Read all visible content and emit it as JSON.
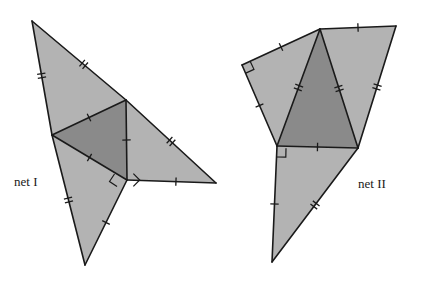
{
  "figure": {
    "canvas": {
      "width": 424,
      "height": 285,
      "background": "#ffffff"
    },
    "palette": {
      "light_face": "#b3b3b3",
      "mid_face": "#a8a8a8",
      "dark_face": "#8a8a8a",
      "outline": "#1a1a1a",
      "label_color": "#1a1a1a"
    },
    "labels": [
      {
        "id": "net-1-label",
        "text": "net I",
        "x": 14,
        "y": 186
      },
      {
        "id": "net-2-label",
        "text": "net II",
        "x": 358,
        "y": 188
      }
    ],
    "nets": [
      {
        "id": "net-1",
        "name": "net I",
        "faces": [
          {
            "id": "net-1-face-upper-left",
            "shade": "light_face",
            "points": "32,21 126,100 52,135"
          },
          {
            "id": "net-1-face-lower-left",
            "shade": "light_face",
            "points": "52,135 85,265 127,180"
          },
          {
            "id": "net-1-face-center-dark",
            "shade": "dark_face",
            "points": "52,135 126,100 127,180"
          },
          {
            "id": "net-1-face-right",
            "shade": "light_face",
            "points": "126,100 216,183 127,180"
          }
        ],
        "edges": [
          "32,21 126,100",
          "32,21 52,135",
          "52,135 126,100",
          "52,135 127,180",
          "52,135 85,265",
          "85,265 127,180",
          "126,100 127,180",
          "126,100 216,183",
          "127,180 216,183"
        ],
        "right_angle_marks": [
          {
            "id": "net-1-right-angle-inner",
            "x": 127,
            "y": 180,
            "dx": 1,
            "dy": -1,
            "size": 9
          },
          {
            "id": "net-1-right-angle-outer",
            "x": 122,
            "y": 179,
            "dx": -0.55,
            "dy": 0.83,
            "size": 9
          }
        ],
        "tick_marks": [
          {
            "id": "t1",
            "edge": "32,21 126,100",
            "t": 0.55,
            "count": 2,
            "spacing": 4
          },
          {
            "id": "t2",
            "edge": "32,21 52,135",
            "t": 0.48,
            "count": 2,
            "spacing": 4
          },
          {
            "id": "t3",
            "edge": "52,135 126,100",
            "t": 0.5,
            "count": 1,
            "spacing": 4
          },
          {
            "id": "t4",
            "edge": "52,135 127,180",
            "t": 0.5,
            "count": 1,
            "spacing": 4
          },
          {
            "id": "t5",
            "edge": "52,135 85,265",
            "t": 0.5,
            "count": 2,
            "spacing": 4
          },
          {
            "id": "t6",
            "edge": "85,265 127,180",
            "t": 0.5,
            "count": 1,
            "spacing": 4
          },
          {
            "id": "t7",
            "edge": "126,100 127,180",
            "t": 0.5,
            "count": 1,
            "spacing": 4
          },
          {
            "id": "t8",
            "edge": "126,100 216,183",
            "t": 0.5,
            "count": 2,
            "spacing": 4
          },
          {
            "id": "t9",
            "edge": "127,180 216,183",
            "t": 0.55,
            "count": 1,
            "spacing": 4
          }
        ]
      },
      {
        "id": "net-2",
        "name": "net II",
        "faces": [
          {
            "id": "net-2-face-left-wing",
            "shade": "light_face",
            "points": "242,65 320,29 277,146"
          },
          {
            "id": "net-2-face-right-wing",
            "shade": "light_face",
            "points": "320,29 396,26 358,148"
          },
          {
            "id": "net-2-face-center-dark",
            "shade": "dark_face",
            "points": "320,29 358,148 277,146"
          },
          {
            "id": "net-2-face-bottom",
            "shade": "light_face",
            "points": "277,146 358,148 272,262"
          }
        ],
        "edges": [
          "242,65 320,29",
          "242,65 277,146",
          "320,29 277,146",
          "320,29 396,26",
          "320,29 358,148",
          "396,26 358,148",
          "277,146 358,148",
          "277,146 272,262",
          "272,262 358,148"
        ],
        "right_angle_marks": [
          {
            "id": "net-2-right-angle-topleft",
            "x": 242,
            "y": 65,
            "dx": 0.9,
            "dy": -0.42,
            "size": 9
          },
          {
            "id": "net-2-right-angle-bottomleft",
            "x": 277,
            "y": 148,
            "dx": 1,
            "dy": 0.02,
            "size": 9
          }
        ],
        "tick_marks": [
          {
            "id": "u1",
            "edge": "242,65 320,29",
            "t": 0.5,
            "count": 1,
            "spacing": 4
          },
          {
            "id": "u2",
            "edge": "242,65 277,146",
            "t": 0.5,
            "count": 1,
            "spacing": 4
          },
          {
            "id": "u3",
            "edge": "320,29 277,146",
            "t": 0.5,
            "count": 2,
            "spacing": 4
          },
          {
            "id": "u4",
            "edge": "320,29 396,26",
            "t": 0.5,
            "count": 1,
            "spacing": 4
          },
          {
            "id": "u5",
            "edge": "320,29 358,148",
            "t": 0.5,
            "count": 2,
            "spacing": 4
          },
          {
            "id": "u6",
            "edge": "396,26 358,148",
            "t": 0.5,
            "count": 2,
            "spacing": 4
          },
          {
            "id": "u7",
            "edge": "277,146 358,148",
            "t": 0.5,
            "count": 1,
            "spacing": 4
          },
          {
            "id": "u8",
            "edge": "277,146 272,262",
            "t": 0.5,
            "count": 1,
            "spacing": 4
          },
          {
            "id": "u9",
            "edge": "272,262 358,148",
            "t": 0.5,
            "count": 2,
            "spacing": 4
          }
        ]
      }
    ]
  }
}
